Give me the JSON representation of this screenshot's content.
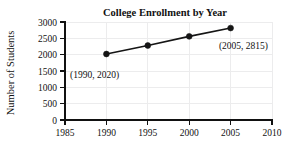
{
  "chart_data": {
    "type": "line",
    "title": "College Enrollment by Year",
    "xlabel": "",
    "ylabel": "Number of Students",
    "x": [
      1990,
      1995,
      2000,
      2005
    ],
    "values": [
      2020,
      2280,
      2560,
      2815
    ],
    "series": [
      {
        "name": "College Enrollment",
        "x": [
          1990,
          1995,
          2000,
          2005
        ],
        "values": [
          2020,
          2280,
          2560,
          2815
        ]
      }
    ],
    "xlim": [
      1985,
      2010
    ],
    "ylim": [
      0,
      3000
    ],
    "xticks": [
      1985,
      1990,
      1995,
      2000,
      2005,
      2010
    ],
    "yticks": [
      0,
      500,
      1000,
      1500,
      2000,
      2500,
      3000
    ],
    "xtick_labels": [
      "1985",
      "1990",
      "1995",
      "2000",
      "2005",
      "2010"
    ],
    "ytick_labels": [
      "0",
      "500",
      "1000",
      "1500",
      "2000",
      "2500",
      "3000"
    ],
    "grid": true,
    "legend": false,
    "legend_position": "none",
    "marker": "filled-circle",
    "annotations": [
      {
        "text": "(1990, 2020)",
        "x": 1990,
        "y": 2020,
        "placement": "below-right-of-point"
      },
      {
        "text": "(2005, 2815)",
        "x": 2005,
        "y": 2815,
        "placement": "below-left-of-point"
      }
    ],
    "colors": {
      "line": "#151515",
      "marker": "#151515",
      "grid": "#ececed",
      "axis": "#111111",
      "background": "#ffffff",
      "text": "#111111"
    }
  }
}
